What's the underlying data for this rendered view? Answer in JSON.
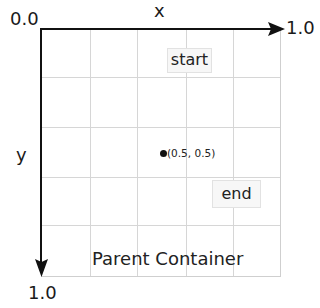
{
  "diagram": {
    "origin_label": "0.0",
    "x_axis": {
      "label": "x",
      "end_label": "1.0"
    },
    "y_axis": {
      "label": "y",
      "end_label": "1.0"
    },
    "container_label": "Parent Container",
    "grid": {
      "columns": 5,
      "rows": 5
    },
    "boxes": [
      {
        "label": "start"
      },
      {
        "label": "end"
      }
    ],
    "point": {
      "label": "(0.5, 0.5)",
      "x": 0.5,
      "y": 0.5
    },
    "colors": {
      "axis": "#111111",
      "grid": "#d6d6d6",
      "box_bg": "#f7f7f7",
      "box_border": "#e2e2e2"
    }
  }
}
